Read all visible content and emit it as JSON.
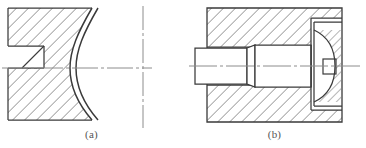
{
  "plate": {
    "width": 366,
    "height": 148,
    "background": "#ffffff",
    "line_color": "#3a3a3a",
    "hatch_color": "#6b6b6b",
    "centerline_color": "#8c8c8c",
    "caption_color": "#555555"
  },
  "figures": [
    {
      "id": "figure-a",
      "caption": "(a)",
      "description": "sectioned-block-with-concave-arc-and-step",
      "hatch_angle_deg": 45,
      "hatch_spacing_px": 6,
      "body": {
        "left": 8,
        "top": 8,
        "right": 95,
        "bottom": 120
      },
      "step": {
        "left": 8,
        "top": 46,
        "width": 36,
        "height": 22,
        "chamfer": "diagonal-to-centerline"
      },
      "arc": {
        "type": "concave-double-arc",
        "outer_offset_px": 5,
        "apex_x": 95,
        "top_x": 72,
        "bottom_x": 72
      },
      "centerlines": {
        "horizontal_y": 68,
        "vertical_x": 143
      }
    },
    {
      "id": "figure-b",
      "caption": "(b)",
      "description": "bore-block-with-stepped-shaft-and-conical-seat",
      "hatch_angle_deg": 45,
      "hatch_spacing_px": 6,
      "block": {
        "left": 24,
        "top": 8,
        "right": 159,
        "bottom": 122
      },
      "bore": {
        "top_y": 47,
        "bottom_y": 85,
        "left_x": 12,
        "right_x": 131
      },
      "shaft": {
        "small_diameter_top_y": 48,
        "small_diameter_bottom_y": 84,
        "taper_left_x": 64,
        "taper_right_x": 72,
        "large_top_y": 45,
        "large_bottom_y": 87
      },
      "counterbore": {
        "left": 128,
        "top": 18,
        "right": 158,
        "bottom": 110
      },
      "seat": {
        "type": "curved-hatched-boss-with-notch",
        "notch_left": 140,
        "notch_top": 60,
        "notch_width": 12,
        "notch_height": 14
      },
      "centerlines": {
        "horizontal_y": 66,
        "extends_left_px": 12,
        "extends_right_px": 12
      }
    }
  ]
}
